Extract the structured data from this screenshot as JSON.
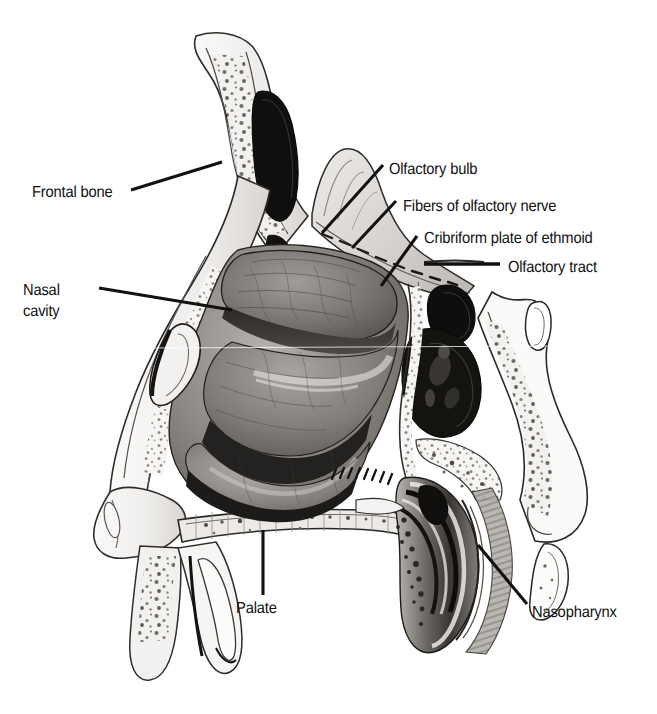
{
  "figure": {
    "kind": "anatomical-illustration",
    "style": "grayscale halftone scan",
    "background_color": "#ffffff",
    "ink_color": "#111111",
    "width": 657,
    "height": 714
  },
  "labels": {
    "frontal_bone": "Frontal bone",
    "nasal_cavity_line1": "Nasal",
    "nasal_cavity_line2": "cavity",
    "olfactory_bulb": "Olfactory bulb",
    "fibers_of_olfactory_nerve": "Fibers of olfactory nerve",
    "cribriform_plate": "Cribriform plate of ethmoid",
    "olfactory_tract": "Olfactory tract",
    "palate": "Palate",
    "nasopharynx": "Nasopharynx"
  },
  "leader_lines": [
    {
      "name": "frontal-bone-leader",
      "from": [
        131,
        190
      ],
      "to": [
        222,
        162
      ],
      "style": "straight"
    },
    {
      "name": "nasal-cavity-leader",
      "from": [
        99,
        288
      ],
      "to": [
        232,
        310
      ],
      "style": "straight"
    },
    {
      "name": "olfactory-bulb-leader",
      "from": [
        383,
        165
      ],
      "to": [
        322,
        233
      ],
      "style": "straight"
    },
    {
      "name": "fibers-leader",
      "from": [
        396,
        201
      ],
      "to": [
        352,
        248
      ],
      "style": "straight"
    },
    {
      "name": "cribriform-leader",
      "from": [
        417,
        236
      ],
      "to": [
        381,
        286
      ],
      "style": "straight"
    },
    {
      "name": "olfactory-tract-leader",
      "from": [
        424,
        264
      ],
      "to": [
        500,
        264
      ],
      "style": "horizontal-bar"
    },
    {
      "name": "palate-leader",
      "from": [
        263,
        530
      ],
      "to": [
        263,
        595
      ],
      "style": "vertical"
    },
    {
      "name": "nasopharynx-leader",
      "from": [
        478,
        545
      ],
      "to": [
        527,
        604
      ],
      "style": "straight"
    }
  ]
}
